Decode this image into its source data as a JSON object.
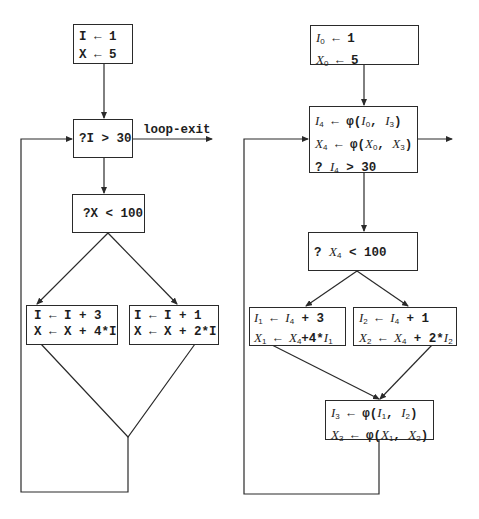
{
  "left_diagram": {
    "init_box": {
      "lines": [
        "I ← 1",
        "X ← 5"
      ]
    },
    "loop_test_box": {
      "lines": [
        "?I > 30"
      ]
    },
    "exit_label": "loop-exit",
    "cond_box": {
      "lines": [
        "?X < 100"
      ]
    },
    "branch_left_box": {
      "lines": [
        "I ← I + 3",
        "X ← X + 4*I"
      ]
    },
    "branch_right_box": {
      "lines": [
        "I ← I + 1",
        "X ← X + 2*I"
      ]
    }
  },
  "right_diagram": {
    "init_box": {
      "lines": [
        [
          {
            "v": "I",
            "s": "0"
          },
          {
            "t": " ← 1"
          }
        ],
        [
          {
            "v": "X",
            "s": "0"
          },
          {
            "t": " ← 5"
          }
        ]
      ]
    },
    "loop_header_box": {
      "lines": [
        [
          {
            "v": "I",
            "s": "4"
          },
          {
            "t": " ← φ("
          },
          {
            "v": "I",
            "s": "0"
          },
          {
            "t": ", "
          },
          {
            "v": "I",
            "s": "3"
          },
          {
            "t": ")"
          }
        ],
        [
          {
            "v": "X",
            "s": "4"
          },
          {
            "t": " ← φ("
          },
          {
            "v": "X",
            "s": "0"
          },
          {
            "t": ", "
          },
          {
            "v": "X",
            "s": "3"
          },
          {
            "t": ")"
          }
        ],
        [
          {
            "t": "? "
          },
          {
            "v": "I",
            "s": "4"
          },
          {
            "t": " > 30"
          }
        ]
      ]
    },
    "cond_box": {
      "lines": [
        [
          {
            "t": "? "
          },
          {
            "v": "X",
            "s": "4"
          },
          {
            "t": " < 100"
          }
        ]
      ]
    },
    "branch_left_box": {
      "lines": [
        [
          {
            "v": "I",
            "s": "1"
          },
          {
            "t": " ← "
          },
          {
            "v": "I",
            "s": "4"
          },
          {
            "t": " + 3"
          }
        ],
        [
          {
            "v": "X",
            "s": "1"
          },
          {
            "t": " ← "
          },
          {
            "v": "X",
            "s": "4"
          },
          {
            "t": "+4*"
          },
          {
            "v": "I",
            "s": "1"
          }
        ]
      ]
    },
    "branch_right_box": {
      "lines": [
        [
          {
            "v": "I",
            "s": "2"
          },
          {
            "t": " ← "
          },
          {
            "v": "I",
            "s": "4"
          },
          {
            "t": " + 1"
          }
        ],
        [
          {
            "v": "X",
            "s": "2"
          },
          {
            "t": " ← "
          },
          {
            "v": "X",
            "s": "4"
          },
          {
            "t": " + 2*"
          },
          {
            "v": "I",
            "s": "2"
          }
        ]
      ]
    },
    "merge_box": {
      "lines": [
        [
          {
            "v": "I",
            "s": "3"
          },
          {
            "t": " ← φ("
          },
          {
            "v": "I",
            "s": "1"
          },
          {
            "t": ", "
          },
          {
            "v": "I",
            "s": "2"
          },
          {
            "t": ")"
          }
        ],
        [
          {
            "v": "X",
            "s": "3"
          },
          {
            "t": " ← φ("
          },
          {
            "v": "X",
            "s": "1"
          },
          {
            "t": ", "
          },
          {
            "v": "X",
            "s": "2"
          },
          {
            "t": ")"
          }
        ]
      ]
    }
  },
  "colors": {
    "ink": "#2a2a2a",
    "background": "#ffffff"
  }
}
